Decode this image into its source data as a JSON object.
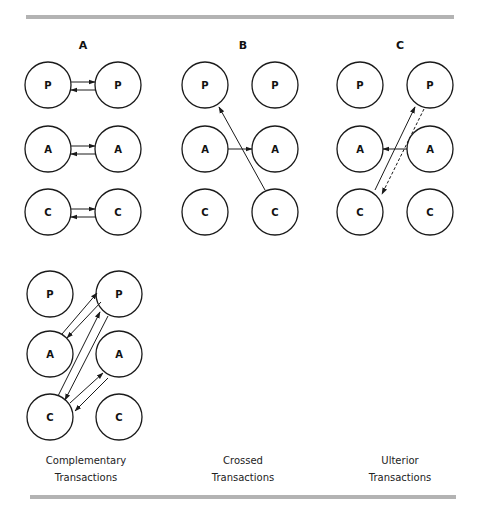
{
  "figure": {
    "rules_color": "#b3b3b3",
    "panels": [
      {
        "id": "A",
        "heading": "A",
        "caption_line1": "Complementary",
        "caption_line2": "Transactions"
      },
      {
        "id": "B",
        "heading": "B",
        "caption_line1": "Crossed",
        "caption_line2": "Transactions"
      },
      {
        "id": "C",
        "heading": "C",
        "caption_line1": "Ulterior",
        "caption_line2": "Transactions"
      }
    ],
    "ego_states": {
      "parent": "P",
      "adult": "A",
      "child": "C"
    }
  }
}
